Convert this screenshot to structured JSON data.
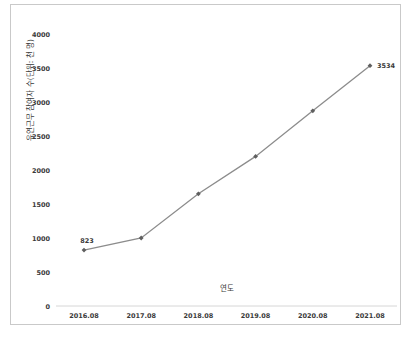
{
  "page": {
    "background": "#ffffff",
    "frame_border_color": "#c9c9c9"
  },
  "chart_data": {
    "type": "line",
    "title": "",
    "xlabel": "연도",
    "ylabel": "유연근무 참여자 수(단위: 천 명)",
    "categories": [
      "2016.08",
      "2017.08",
      "2018.08",
      "2019.08",
      "2020.08",
      "2021.08"
    ],
    "values": [
      823,
      1000,
      1650,
      2200,
      2870,
      3534
    ],
    "data_labels": [
      {
        "index": 0,
        "text": "823"
      },
      {
        "index": 5,
        "text": "3534"
      }
    ],
    "ylim": [
      0,
      4000
    ],
    "ytick_step": 500,
    "yticks": [
      0,
      500,
      1000,
      1500,
      2000,
      2500,
      3000,
      3500,
      4000
    ],
    "grid": false,
    "legend": false,
    "marker_shape": "diamond",
    "colors": {
      "line": "#8c8c8c",
      "marker": "#5f5f5f",
      "axis": "#d6d6d6",
      "text": "#3a3a3a"
    }
  }
}
